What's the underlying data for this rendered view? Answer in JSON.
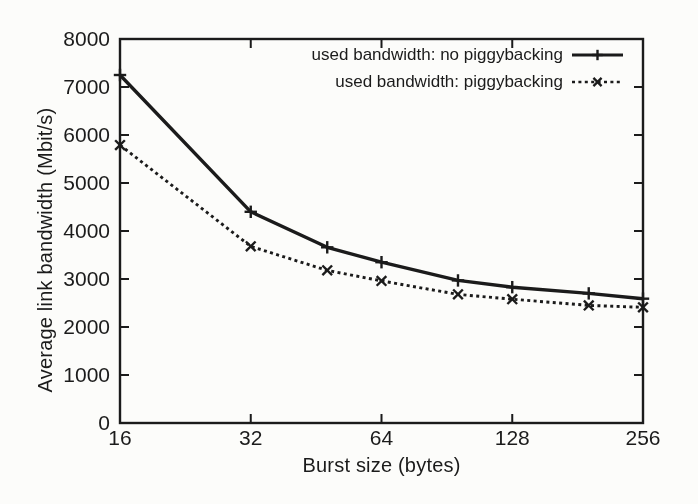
{
  "figure": {
    "background": "#fcfcfa",
    "ink": "#1b1b1b"
  },
  "chart_data": {
    "type": "line",
    "title": "",
    "xlabel": "Burst size (bytes)",
    "ylabel": "Average link bandwidth (Mbit/s)",
    "x_scale": "log2",
    "xlim": [
      16,
      256
    ],
    "ylim": [
      0,
      8000
    ],
    "x_ticks": [
      16,
      32,
      64,
      128,
      256
    ],
    "y_ticks": [
      0,
      1000,
      2000,
      3000,
      4000,
      5000,
      6000,
      7000,
      8000
    ],
    "grid": false,
    "legend_position": "top-right-inside",
    "x": [
      16,
      32,
      48,
      64,
      96,
      128,
      192,
      256
    ],
    "series": [
      {
        "name": "used bandwidth: no piggybacking",
        "line_style": "solid",
        "marker": "plus",
        "values": [
          7250,
          4400,
          3660,
          3350,
          2970,
          2830,
          2700,
          2590
        ]
      },
      {
        "name": "used bandwidth: piggybacking",
        "line_style": "dashed",
        "marker": "cross",
        "values": [
          5790,
          3680,
          3180,
          2960,
          2680,
          2580,
          2450,
          2410
        ]
      }
    ]
  }
}
